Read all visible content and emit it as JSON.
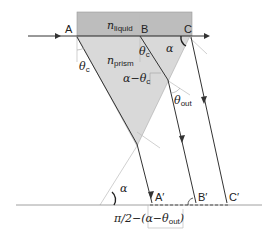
{
  "diagram": {
    "type": "optical-prism-refraction",
    "colors": {
      "liquid": "#bdbdbd",
      "prism": "#d9d9d9",
      "ray": "#333333",
      "normal": "#bbbbbb",
      "ground": "#888888"
    },
    "points": {
      "A": "A",
      "B": "B",
      "C": "C",
      "A_prime": "A′",
      "B_prime": "B′",
      "C_prime": "C′"
    },
    "media": {
      "liquid_n": "n",
      "liquid_sub": "liquid",
      "prism_n": "n",
      "prism_sub": "prism"
    },
    "angles": {
      "theta_c_left": "θ",
      "theta_c_left_sub": "c",
      "theta_c_B": "θ",
      "theta_c_B_sub": "c",
      "alpha_top": "α",
      "alpha_minus_theta": "α−θ",
      "alpha_minus_theta_sub": "c",
      "theta_out": "θ",
      "theta_out_sub": "out",
      "alpha_bottom": "α"
    },
    "formula": {
      "prefix": "π/2−(α−θ",
      "sub": "out",
      "suffix": ")"
    }
  }
}
